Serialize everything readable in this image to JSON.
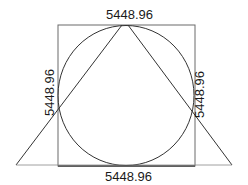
{
  "diagram": {
    "type": "geometric-construction",
    "shapes": {
      "square": {
        "x": 58,
        "y": 25,
        "width": 137,
        "height": 141,
        "stroke": "#555555"
      },
      "circle": {
        "cx": 126,
        "cy": 95.5,
        "rx": 68,
        "ry": 70,
        "stroke": "#333333"
      },
      "triangle": {
        "apex_left": [
          122,
          25
        ],
        "apex_right": [
          128,
          25
        ],
        "base_left": [
          16,
          165
        ],
        "base_right": [
          232,
          165
        ],
        "stroke": "#333333"
      }
    },
    "labels": {
      "top": "5448.96",
      "bottom": "5448.96",
      "left": "5448.96",
      "right": "5448.96"
    }
  }
}
